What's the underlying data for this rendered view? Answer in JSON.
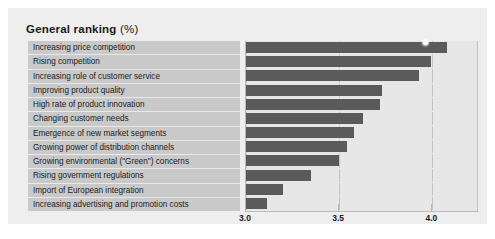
{
  "chart": {
    "title_main": "General ranking",
    "title_unit": "(%)"
  },
  "colors": {
    "bar": "#5a5a5a",
    "label_panel": "#c9c9c9",
    "plot_background": "#e7e7e7",
    "panel_background": "#eeeeee",
    "gridline": "#c4c4c4",
    "marker": "#fefefe"
  },
  "chart_data": {
    "type": "bar",
    "orientation": "horizontal",
    "title": "General ranking (%)",
    "xlabel": "",
    "ylabel": "",
    "xlim": [
      3.0,
      4.25
    ],
    "xticks": [
      3.0,
      3.5,
      4.0
    ],
    "xticklabels": [
      "3.0",
      "3.5",
      "4.0"
    ],
    "grid": true,
    "legend": null,
    "categories": [
      "Increasing price competition",
      "Rising competition",
      "Increasing role of customer service",
      "Improving product quality",
      "High rate of product innovation",
      "Changing customer needs",
      "Emergence of new market segments",
      "Growing power of distribution channels",
      "Growing environmental (\"Green\") concerns",
      "Rising government regulations",
      "Import of European integration",
      "Increasing advertising and promotion costs"
    ],
    "values": [
      4.08,
      3.99,
      3.93,
      3.73,
      3.72,
      3.63,
      3.58,
      3.54,
      3.5,
      3.35,
      3.2,
      3.11
    ],
    "annotations": [
      {
        "name": "top-bar-marker",
        "shape": "circle",
        "color": "#fefefe",
        "x": 4.08,
        "category": "Increasing price competition"
      }
    ]
  }
}
